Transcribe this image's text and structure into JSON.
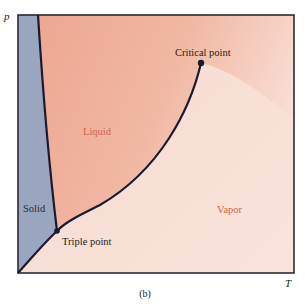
{
  "figure": {
    "caption": "(b)"
  },
  "axes": {
    "y_label": "p",
    "x_label": "T"
  },
  "regions": [
    {
      "name": "solid",
      "label": "Solid",
      "color": "#9aa6bf"
    },
    {
      "name": "liquid",
      "label": "Liquid",
      "color": "#eeae99"
    },
    {
      "name": "vapor",
      "label": "Vapor",
      "color": "#f8e0d6"
    }
  ],
  "points": {
    "triple": {
      "label": "Triple point"
    },
    "critical": {
      "label": "Critical point"
    }
  },
  "colors": {
    "curve": "#1a1a2e",
    "frame": "#2a2a3a",
    "region_label": "#d0654a",
    "text": "#222222"
  }
}
